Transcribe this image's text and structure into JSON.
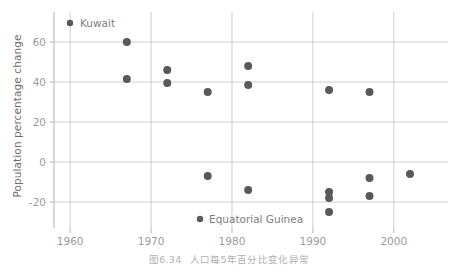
{
  "figure": {
    "caption_number": "图6.34",
    "caption_text": "人口每5年百分比变化异常"
  },
  "chart_data": {
    "type": "scatter",
    "title": "",
    "xlabel": "",
    "ylabel": "Population percentage change",
    "xlim": [
      1958,
      2006.7
    ],
    "ylim": [
      -33,
      72
    ],
    "xticks": [
      1960,
      1970,
      1980,
      1990,
      2000
    ],
    "xtick_labels": [
      "1960",
      "1970",
      "1980",
      "1990",
      "2000"
    ],
    "yticks": [
      -20,
      0,
      20,
      40,
      60
    ],
    "ytick_labels": [
      "-20",
      "0",
      "20",
      "40",
      "60"
    ],
    "grid": "horizontal-and-vertical",
    "legend": "none",
    "marker_color": "#595959",
    "marker_size": 4.0,
    "grid_color": "#c8c8c8",
    "points": [
      {
        "x": 1967,
        "y": 60.0
      },
      {
        "x": 1967,
        "y": 41.5
      },
      {
        "x": 1972,
        "y": 46.0
      },
      {
        "x": 1972,
        "y": 39.5
      },
      {
        "x": 1977,
        "y": 35.0
      },
      {
        "x": 1982,
        "y": 48.0
      },
      {
        "x": 1982,
        "y": 38.5
      },
      {
        "x": 1977,
        "y": -7.0
      },
      {
        "x": 1982,
        "y": -14.0
      },
      {
        "x": 1992,
        "y": 36.0
      },
      {
        "x": 1992,
        "y": -15.0
      },
      {
        "x": 1992,
        "y": -18.0
      },
      {
        "x": 1992,
        "y": -25.0
      },
      {
        "x": 1997,
        "y": 35.0
      },
      {
        "x": 1997,
        "y": -8.0
      },
      {
        "x": 1997,
        "y": -17.0
      },
      {
        "x": 2002,
        "y": -6.0
      }
    ],
    "annotations": [
      {
        "label": "Kuwait",
        "marker_x": 70,
        "marker_y": 23,
        "text_x": 80,
        "text_y": 27
      },
      {
        "label": "Equatorial Guinea",
        "marker_x": 200,
        "marker_y": 219,
        "text_x": 209,
        "text_y": 223
      }
    ]
  }
}
